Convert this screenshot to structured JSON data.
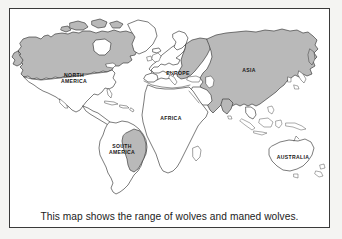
{
  "figure": {
    "type": "world-map",
    "caption": "This map shows the range of wolves and maned wolves.",
    "frame_border_color": "#3a3a3a",
    "background_color": "#ffffff",
    "outer_background_color": "#f4f4f2"
  },
  "legend_semantics": {
    "shaded_meaning": "range of wolves and maned wolves",
    "shaded_fill_color": "#b9b9b9",
    "unshaded_fill_color": "#ffffff",
    "coastline_color": "#2b2b2b"
  },
  "labels": {
    "north_america": "NORTH\nAMERICA",
    "south_america": "SOUTH\nAMERICA",
    "europe": "EUROPE",
    "africa": "AFRICA",
    "asia": "ASIA",
    "australia": "AUSTRALIA"
  },
  "regions": [
    {
      "name": "North America",
      "label": "NORTH AMERICA",
      "shaded": true,
      "note": "Canada, Alaska and northern USA shaded"
    },
    {
      "name": "Greenland",
      "label": "",
      "shaded": false,
      "note": "outline only, unshaded"
    },
    {
      "name": "South America",
      "label": "SOUTH AMERICA",
      "shaded": true,
      "note": "central-eastern strip shaded (maned wolf)"
    },
    {
      "name": "Europe",
      "label": "EUROPE",
      "shaded": true,
      "note": "eastern Europe shaded, Scandinavia unshaded"
    },
    {
      "name": "Africa",
      "label": "AFRICA",
      "shaded": false,
      "note": "outline only, unshaded"
    },
    {
      "name": "Asia",
      "label": "ASIA",
      "shaded": true,
      "note": "Russia, Central Asia, India, China shaded"
    },
    {
      "name": "Australia",
      "label": "AUSTRALIA",
      "shaded": false,
      "note": "outline only, unshaded"
    }
  ]
}
